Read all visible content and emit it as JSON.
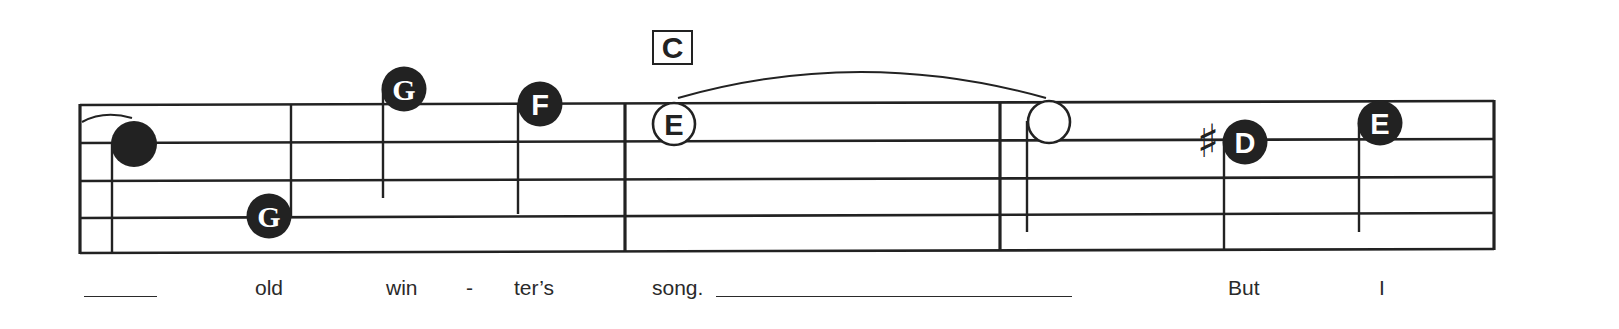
{
  "colors": {
    "ink": "#222222",
    "paper": "#ffffff",
    "note_text": "#ffffff"
  },
  "chord": {
    "label": "C"
  },
  "notes": [
    {
      "name": "note-1",
      "letter": "",
      "type": "filled"
    },
    {
      "name": "note-2",
      "letter": "G",
      "type": "filled"
    },
    {
      "name": "note-3",
      "letter": "G",
      "type": "filled"
    },
    {
      "name": "note-4",
      "letter": "F",
      "type": "filled"
    },
    {
      "name": "note-5",
      "letter": "E",
      "type": "open"
    },
    {
      "name": "note-6",
      "letter": "",
      "type": "open"
    },
    {
      "name": "note-7",
      "letter": "D",
      "type": "filled",
      "accidental": "♯"
    },
    {
      "name": "note-8",
      "letter": "E",
      "type": "filled"
    }
  ],
  "lyrics": {
    "w1": "old",
    "w2": "win",
    "w3": "-",
    "w4": "ter’s",
    "w5": "song.",
    "w6": "But",
    "w7": "I"
  }
}
